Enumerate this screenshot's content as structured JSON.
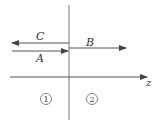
{
  "diagram": {
    "title": "",
    "interface": {
      "x": 69,
      "y1": 5,
      "y2": 120
    },
    "waves": [
      {
        "id": "C",
        "label": "C",
        "type": "reflected",
        "direction": "left",
        "x1": 69,
        "x2": 12,
        "y": 43,
        "label_x": 40,
        "label_y": 39
      },
      {
        "id": "A",
        "label": "A",
        "type": "incident",
        "direction": "right",
        "x1": 12,
        "x2": 68,
        "y": 51,
        "label_x": 40,
        "label_y": 61
      },
      {
        "id": "B",
        "label": "B",
        "type": "transmitted",
        "direction": "right",
        "x1": 69,
        "x2": 126,
        "y": 48,
        "label_x": 89,
        "label_y": 46
      }
    ],
    "axis": {
      "label": "z",
      "x1": 10,
      "x2": 147,
      "y": 77
    },
    "regions": [
      {
        "label": "1",
        "cx": 46,
        "cy": 99
      },
      {
        "label": "2",
        "cx": 92,
        "cy": 99
      }
    ],
    "colors": {
      "line": "#555555",
      "text": "#333333"
    }
  }
}
